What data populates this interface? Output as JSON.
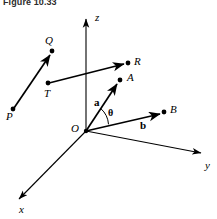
{
  "figure": {
    "caption": "Figure 10.33",
    "background_color": "#ffffff",
    "stroke_color": "#000000"
  },
  "axes": [
    {
      "name": "z",
      "label": "z",
      "label_x": 95,
      "label_y": 12
    },
    {
      "name": "y",
      "label": "y",
      "label_x": 205,
      "label_y": 160
    },
    {
      "name": "x",
      "label": "x",
      "label_x": 19,
      "label_y": 204
    }
  ],
  "points": [
    {
      "name": "O",
      "label": "O",
      "label_x": 71,
      "label_y": 123
    },
    {
      "name": "P",
      "label": "P",
      "label_x": 6,
      "label_y": 111
    },
    {
      "name": "Q",
      "label": "Q",
      "label_x": 45,
      "label_y": 35
    },
    {
      "name": "T",
      "label": "T",
      "label_x": 44,
      "label_y": 88
    },
    {
      "name": "R",
      "label": "R",
      "label_x": 134,
      "label_y": 56
    },
    {
      "name": "A",
      "label": "A",
      "label_x": 127,
      "label_y": 72
    },
    {
      "name": "B",
      "label": "B",
      "label_x": 170,
      "label_y": 104
    }
  ],
  "vector_labels": [
    {
      "name": "vector-a",
      "label": "a",
      "label_x": 94,
      "label_y": 97
    },
    {
      "name": "vector-b",
      "label": "b",
      "label_x": 140,
      "label_y": 120
    }
  ],
  "angle": {
    "name": "theta",
    "label": "θ",
    "label_x": 108,
    "label_y": 108
  }
}
